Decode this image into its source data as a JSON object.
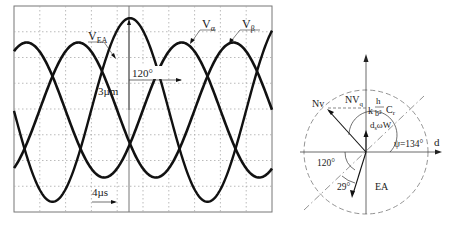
{
  "oscilloscope": {
    "labels": {
      "vea": "V",
      "vea_sub": "EA",
      "valpha": "V",
      "valpha_sub": "α",
      "vbeta": "V",
      "vbeta_sub": "β",
      "phase": "120°",
      "amplitude": "3µm",
      "time": "4µs"
    },
    "grid": {
      "cols": 10,
      "rows": 8
    }
  },
  "vector_diagram": {
    "labels": {
      "nv": "Nv",
      "nvq": "NV",
      "nvq_sub": "q",
      "k": "k",
      "h": "h",
      "b2": "b²",
      "cr": "C",
      "cr_sub": "r",
      "dsw": "d",
      "dsw_sub": "s",
      "omega_w": "ωW",
      "psi": "ψ=134°",
      "d_axis": "d",
      "angle_120": "120°",
      "angle_29": "29°",
      "ea": "EA"
    }
  },
  "chart_data": {
    "type": "line",
    "title": "",
    "xlabel": "time (4µs/div)",
    "ylabel": "amplitude (3µm)",
    "series": [
      {
        "name": "V_EA",
        "amplitude": 3.4,
        "phase_deg": 0,
        "note": "large-amplitude reference signal, peak at center"
      },
      {
        "name": "V_α",
        "amplitude": 2.5,
        "phase_deg": 120,
        "note": "lags V_EA by 120°"
      },
      {
        "name": "V_β",
        "amplitude": 2.5,
        "phase_deg": 240
      }
    ],
    "annotations": [
      "120°",
      "3µm",
      "4µs"
    ],
    "grid": true,
    "vector": {
      "psi_deg": 134,
      "angle1_deg": 120,
      "angle2_deg": 29,
      "axes": [
        "d",
        "q"
      ]
    }
  }
}
